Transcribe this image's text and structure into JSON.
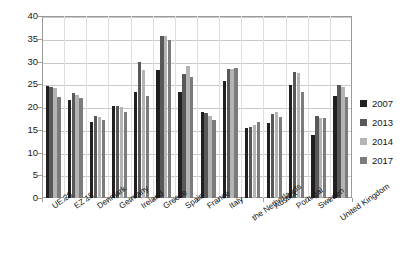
{
  "chart_data": {
    "type": "bar",
    "title": "",
    "subtitle": "",
    "xlabel": "",
    "ylabel": "",
    "ylim": [
      0,
      40
    ],
    "ytick_step": 5,
    "yticks": [
      0,
      5,
      10,
      15,
      20,
      25,
      30,
      35,
      40
    ],
    "grid": true,
    "legend_position": "right",
    "categories": [
      "UE 28",
      "EZ 18",
      "Denmark",
      "Germany",
      "Ireland",
      "Greece",
      "Spain",
      "France",
      "Italy",
      "the Netherlands",
      "Austria",
      "Portugal",
      "Sweden",
      "United Kingdom"
    ],
    "series": [
      {
        "name": "2007",
        "color": "#231f20",
        "values": [
          24.6,
          21.5,
          16.7,
          20.2,
          23.2,
          28.1,
          23.3,
          19.0,
          25.7,
          15.4,
          16.5,
          24.9,
          13.9,
          22.5
        ]
      },
      {
        "name": "2013",
        "color": "#585858",
        "values": [
          24.4,
          23.0,
          18.1,
          20.2,
          30.0,
          35.5,
          27.3,
          18.6,
          28.4,
          15.5,
          18.4,
          27.6,
          18.1,
          24.8
        ]
      },
      {
        "name": "2014",
        "color": "#b4b4b4",
        "values": [
          24.2,
          22.7,
          17.7,
          19.9,
          28.1,
          35.7,
          29.1,
          18.1,
          28.3,
          16.1,
          18.8,
          27.4,
          17.6,
          24.3
        ]
      },
      {
        "name": "2017",
        "color": "#7c7c7c",
        "values": [
          22.3,
          22.0,
          17.2,
          18.9,
          22.5,
          34.8,
          26.6,
          17.1,
          28.6,
          16.8,
          17.9,
          23.3,
          17.6,
          22.2
        ]
      }
    ]
  },
  "legend": {
    "items": [
      {
        "label": "2007"
      },
      {
        "label": "2013"
      },
      {
        "label": "2014"
      },
      {
        "label": "2017"
      }
    ]
  }
}
